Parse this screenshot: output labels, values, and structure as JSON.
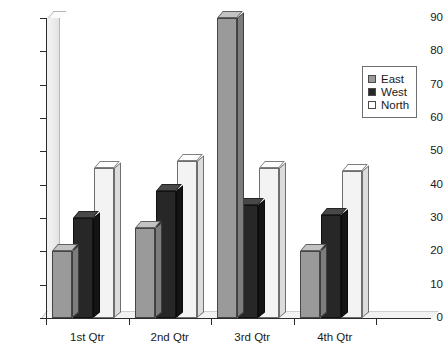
{
  "chart_data": {
    "type": "bar",
    "title": "",
    "subtitle": "",
    "xlabel": "",
    "ylabel": "",
    "categories": [
      "1st Qtr",
      "2nd Qtr",
      "3rd Qtr",
      "4th Qtr"
    ],
    "series": [
      {
        "name": "East",
        "color": "#9a9a9a",
        "values": [
          20,
          27,
          90,
          20
        ]
      },
      {
        "name": "West",
        "color": "#272727",
        "values": [
          30,
          38,
          34,
          31
        ]
      },
      {
        "name": "North",
        "color": "#f3f3f3",
        "values": [
          45,
          47,
          45,
          44
        ]
      }
    ],
    "ylim": [
      0,
      90
    ],
    "y_ticks": [
      0,
      10,
      20,
      30,
      40,
      50,
      60,
      70,
      80,
      90
    ],
    "y_tick_labels": [
      "0",
      "10",
      "20",
      "30",
      "40",
      "50",
      "60",
      "70",
      "80",
      "90"
    ],
    "grid": false,
    "legend_position": "right",
    "style": "3d-clustered-column"
  },
  "legend": {
    "items": [
      {
        "label": "East",
        "swatch": "east-swatch"
      },
      {
        "label": "West",
        "swatch": "west-swatch"
      },
      {
        "label": "North",
        "swatch": "north-swatch"
      }
    ]
  }
}
